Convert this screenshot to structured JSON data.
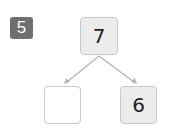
{
  "problem": {
    "number": "5",
    "badge_color": "#6e6e6e"
  },
  "number_bond": {
    "whole": "7",
    "parts": [
      {
        "value": "",
        "state": "blank"
      },
      {
        "value": "6",
        "state": "given"
      }
    ],
    "box_fill": "#ececec",
    "border_color": "#c9c9c9",
    "arrow_color": "#b5b5b5"
  }
}
